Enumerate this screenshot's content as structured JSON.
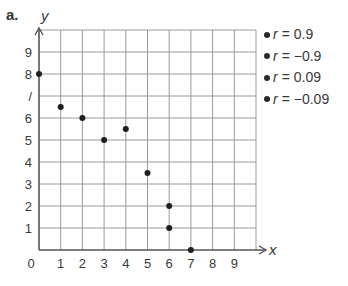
{
  "part_label": "a.",
  "legend": {
    "items": [
      {
        "var": "r",
        "eq": "=",
        "value": "0.9"
      },
      {
        "var": "r",
        "eq": "=",
        "value": "−0.9"
      },
      {
        "var": "r",
        "eq": "=",
        "value": "0.09"
      },
      {
        "var": "r",
        "eq": "=",
        "value": "−0.09"
      }
    ]
  },
  "colors": {
    "grid": "#9a9a9a",
    "axis": "#555555",
    "point": "#1e1e1e",
    "text": "#3a3a3a"
  },
  "chart_data": {
    "type": "scatter",
    "title": "",
    "xlabel": "x",
    "ylabel": "y",
    "xlim": [
      0,
      10
    ],
    "ylim": [
      0,
      10
    ],
    "grid": true,
    "x_ticks": [
      0,
      1,
      2,
      3,
      4,
      5,
      6,
      7,
      8,
      9
    ],
    "y_ticks": [
      1,
      2,
      3,
      4,
      5,
      6,
      7,
      8,
      9
    ],
    "series": [
      {
        "name": "points",
        "points": [
          [
            0,
            8
          ],
          [
            1,
            6.5
          ],
          [
            2,
            6
          ],
          [
            3,
            5
          ],
          [
            4,
            5.5
          ],
          [
            5,
            3.5
          ],
          [
            6,
            2
          ],
          [
            6,
            1
          ],
          [
            7,
            0
          ]
        ]
      }
    ],
    "legend_position": "right",
    "legend": [
      "r = 0.9",
      "r = −0.9",
      "r = 0.09",
      "r = −0.09"
    ]
  }
}
